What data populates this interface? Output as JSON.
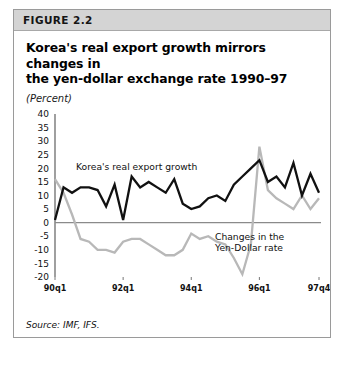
{
  "figure": {
    "banner_label": "FIGURE 2.2",
    "title_line1": "Korea's real export growth mirrors changes in",
    "title_line2": "the yen-dollar exchange rate 1990–97",
    "units": "(Percent)",
    "source": "Source: IMF, IFS."
  },
  "chart_data": {
    "type": "line",
    "title": "Korea's real export growth mirrors changes in the yen-dollar exchange rate 1990–97",
    "subtitle": "(Percent)",
    "xlabel": "",
    "ylabel": "(Percent)",
    "ylim": [
      -20,
      40
    ],
    "yticks": [
      40,
      35,
      30,
      25,
      20,
      15,
      10,
      5,
      0,
      -5,
      -10,
      -15,
      -20
    ],
    "ytick_labels": [
      "40",
      "35",
      "30",
      "25",
      "20",
      "15",
      "10",
      "5",
      "0",
      "-5",
      "-10",
      "-15",
      "-20"
    ],
    "grid": false,
    "zero_line": true,
    "legend_position": "inline-annotation",
    "x": [
      "90q1",
      "90q2",
      "90q3",
      "90q4",
      "91q1",
      "91q2",
      "91q3",
      "91q4",
      "92q1",
      "92q2",
      "92q3",
      "92q4",
      "93q1",
      "93q2",
      "93q3",
      "93q4",
      "94q1",
      "94q2",
      "94q3",
      "94q4",
      "95q1",
      "95q2",
      "95q3",
      "95q4",
      "96q1",
      "96q2",
      "96q3",
      "96q4",
      "97q1",
      "97q2",
      "97q3",
      "97q4"
    ],
    "xticks": [
      "90q1",
      "92q1",
      "94q1",
      "96q1",
      "97q4"
    ],
    "xtick_positions": [
      0,
      8,
      16,
      24,
      31
    ],
    "series": [
      {
        "name": "Korea's real export growth",
        "color": "#111111",
        "width": 2.3,
        "annotation": "Korea's real export growth",
        "values": [
          1,
          13,
          11,
          13,
          13,
          12,
          6,
          14,
          1,
          17,
          13,
          15,
          13,
          11,
          16,
          7,
          5,
          6,
          9,
          10,
          8,
          14,
          17,
          20,
          23,
          15,
          17,
          13,
          22,
          10,
          18,
          11
        ]
      },
      {
        "name": "Changes in the Yen-Dollar rate",
        "color": "#b8b8b8",
        "width": 2.3,
        "annotation": "Changes in the\nYen-Dollar rate",
        "annotation_line1": "Changes in the",
        "annotation_line2": "Yen-Dollar rate",
        "values": [
          16,
          11,
          3,
          -6,
          -7,
          -10,
          -10,
          -11,
          -7,
          -6,
          -6,
          -8,
          -10,
          -12,
          -12,
          -10,
          -4,
          -6,
          -5,
          -7,
          -8,
          -13,
          -19,
          -8,
          3,
          12,
          9,
          7,
          5,
          7,
          3,
          5
        ]
      }
    ],
    "series_plot_overrides": {
      "note": "second series rendered with sharp late spike",
      "series_2_values": [
        16,
        11,
        3,
        -6,
        -7,
        -10,
        -10,
        -11,
        -7,
        -6,
        -6,
        -8,
        -10,
        -12,
        -12,
        -10,
        -4,
        -6,
        -5,
        -7,
        -8,
        -13,
        -19,
        -8,
        28,
        12,
        9,
        7,
        5,
        10,
        5,
        9
      ]
    }
  },
  "annotations": {
    "black_label": "Korea's real export growth",
    "gray_label_line1": "Changes in the",
    "gray_label_line2": "Yen-Dollar rate"
  }
}
